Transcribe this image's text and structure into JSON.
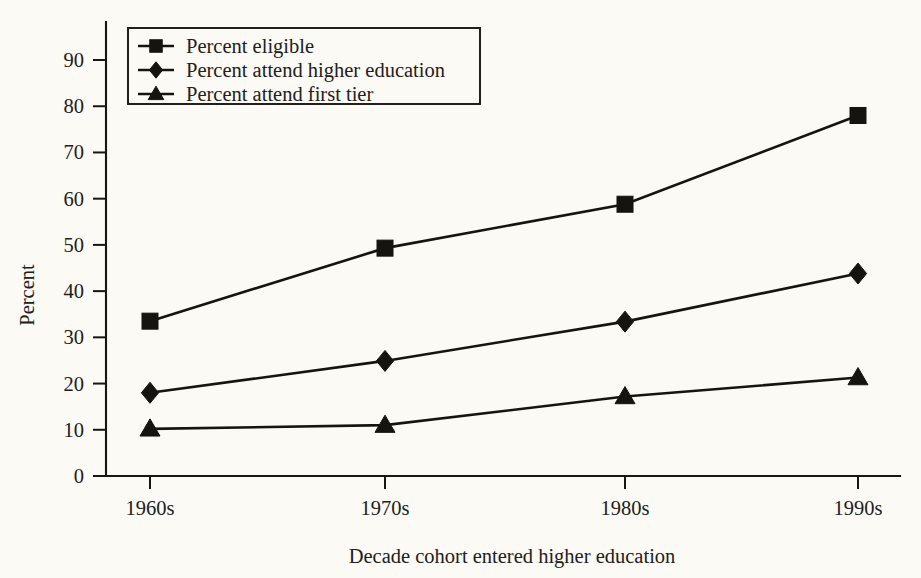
{
  "chart_data": {
    "type": "line",
    "title": "",
    "subtitle": "",
    "xlabel": "Decade cohort entered higher education",
    "ylabel": "Percent",
    "categories": [
      "1960s",
      "1970s",
      "1980s",
      "1990s"
    ],
    "ylim": [
      0,
      95
    ],
    "yticks": [
      0,
      10,
      20,
      30,
      40,
      50,
      60,
      70,
      80,
      90
    ],
    "ytick_labels": [
      "0",
      "10",
      "20",
      "30",
      "40",
      "50",
      "60",
      "70",
      "80",
      "90"
    ],
    "grid": false,
    "legend_position": "top-left",
    "series": [
      {
        "name": "Percent eligible",
        "marker": "square",
        "color": "#15140e",
        "values": [
          33.5,
          49.3,
          58.8,
          78.0
        ]
      },
      {
        "name": "Percent attend higher education",
        "marker": "diamond",
        "color": "#15140e",
        "values": [
          18.0,
          24.9,
          33.4,
          43.8
        ]
      },
      {
        "name": "Percent attend first tier",
        "marker": "triangle",
        "color": "#15140e",
        "values": [
          10.2,
          11.0,
          17.2,
          21.3
        ]
      }
    ]
  },
  "legend": {
    "items": [
      {
        "label": "Percent eligible",
        "marker": "square"
      },
      {
        "label": "Percent attend higher education",
        "marker": "diamond"
      },
      {
        "label": "Percent attend first tier",
        "marker": "triangle"
      }
    ]
  }
}
